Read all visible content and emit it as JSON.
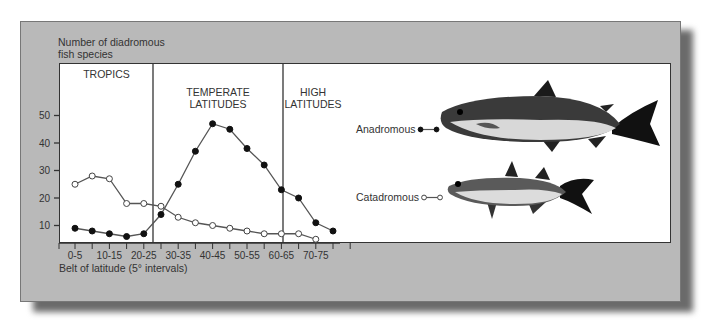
{
  "chart_data": {
    "type": "line",
    "title": "",
    "ylabel": "Number of diadromous fish species",
    "ylabel_lines": [
      "Number of diadromous",
      "fish species"
    ],
    "xlabel": "Belt of latitude (5° intervals)",
    "ylim": [
      0,
      55
    ],
    "yticks": [
      10,
      20,
      30,
      40,
      50
    ],
    "categories": [
      "0-5",
      "5-10",
      "10-15",
      "15-20",
      "20-25",
      "25-30",
      "30-35",
      "35-40",
      "40-45",
      "45-50",
      "50-55",
      "55-60",
      "60-65",
      "65-70",
      "70-75",
      "75-80"
    ],
    "x_tick_labels": [
      "0-5",
      "10-15",
      "20-25",
      "30-35",
      "40-45",
      "50-55",
      "60-65",
      "70-75"
    ],
    "zones": [
      {
        "label_lines": [
          "TROPICS"
        ],
        "range": [
          "0-5",
          "25-30"
        ]
      },
      {
        "label_lines": [
          "TEMPERATE",
          "LATITUDES"
        ],
        "range": [
          "25-30",
          "60-65"
        ]
      },
      {
        "label_lines": [
          "HIGH",
          "LATITUDES"
        ],
        "range": [
          "60-65",
          "75-80"
        ]
      }
    ],
    "series": [
      {
        "name": "Anadromous",
        "marker": "filled-circle",
        "values": [
          9,
          8,
          7,
          6,
          7,
          14,
          25,
          37,
          47,
          45,
          38,
          32,
          23,
          20,
          11,
          8
        ]
      },
      {
        "name": "Catadromous",
        "marker": "open-circle",
        "values": [
          25,
          28,
          27,
          18,
          18,
          17,
          13,
          11,
          10,
          9,
          8,
          7,
          7,
          7,
          5,
          null
        ]
      }
    ],
    "legend": [
      {
        "label": "Anadromous",
        "marker": "filled-circle",
        "illustration": "salmon"
      },
      {
        "label": "Catadromous",
        "marker": "open-circle",
        "illustration": "mullet"
      }
    ],
    "grid": false
  },
  "colors": {
    "panel": "#b9b9b9",
    "plot_bg": "#ffffff",
    "line": "#555555",
    "marker_fill": "#111111"
  }
}
